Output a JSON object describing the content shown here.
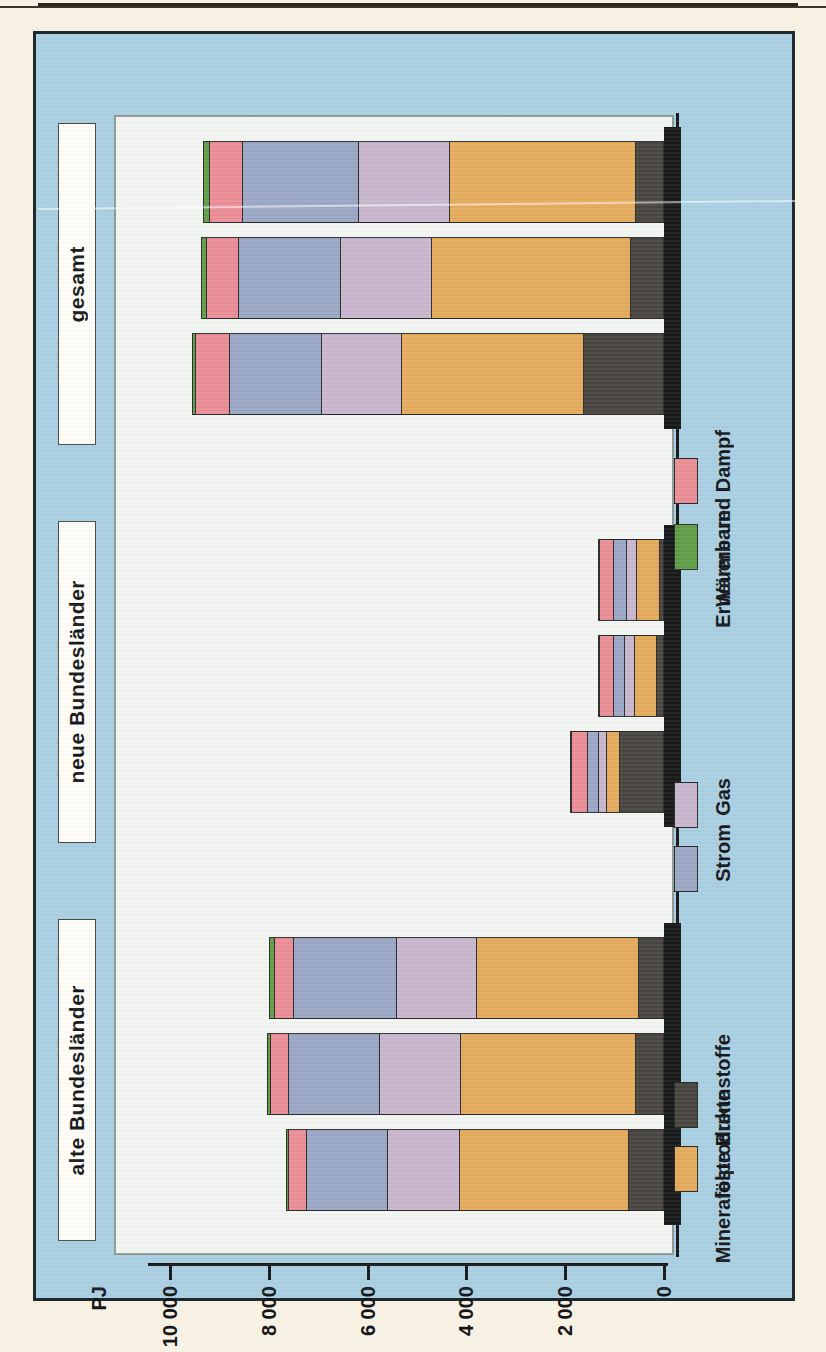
{
  "chart_data": {
    "type": "bar",
    "subtype": "stacked-horizontal",
    "title": "",
    "xlabel": "",
    "ylabel": "PJ",
    "unit": "PJ",
    "axis_ticks": [
      "10000",
      "8000",
      "6000",
      "4000",
      "2000",
      "0"
    ],
    "axis_tick_values": [
      10000,
      8000,
      6000,
      4000,
      2000,
      0
    ],
    "ylim": [
      0,
      10000
    ],
    "grid": false,
    "legend_position": "right",
    "orientation": "rotated-90",
    "categories": [
      "1990",
      "2005",
      "2020"
    ],
    "groups": [
      "alte Bundesländer",
      "neue Bundesländer",
      "gesamt"
    ],
    "series": [
      {
        "name": "feste Brennstoffe",
        "color": "#494641",
        "values": {
          "alte Bundesländer": [
            700,
            540,
            480
          ],
          "neue Bundesländer": [
            900,
            120,
            60
          ],
          "gesamt": [
            1600,
            660,
            540
          ]
        }
      },
      {
        "name": "Mineralölprodukte",
        "color": "#e3ab5c",
        "values": {
          "alte Bundesländer": [
            3440,
            3560,
            3300
          ],
          "neue Bundesländer": [
            260,
            470,
            490
          ],
          "gesamt": [
            3700,
            4030,
            3790
          ]
        }
      },
      {
        "name": "Gas",
        "color": "#c8b6cc",
        "values": {
          "alte Bundesländer": [
            1450,
            1650,
            1640
          ],
          "neue Bundesländer": [
            180,
            200,
            210
          ],
          "gesamt": [
            1630,
            1850,
            1850
          ]
        }
      },
      {
        "name": "Strom",
        "color": "#9aa7c4",
        "values": {
          "alte Bundesländer": [
            1660,
            1850,
            2090
          ],
          "neue Bundesländer": [
            220,
            240,
            260
          ],
          "gesamt": [
            1880,
            2090,
            2350
          ]
        }
      },
      {
        "name": "Wärme und Dampf",
        "color": "#ea8d96",
        "values": {
          "alte Bundesländer": [
            360,
            370,
            380
          ],
          "neue Bundesländer": [
            330,
            280,
            290
          ],
          "gesamt": [
            690,
            650,
            670
          ]
        }
      },
      {
        "name": "Erneuerbare",
        "color": "#5f9e48",
        "values": {
          "alte Bundesländer": [
            40,
            70,
            110
          ],
          "neue Bundesländer": [
            10,
            20,
            30
          ],
          "gesamt": [
            50,
            90,
            140
          ]
        }
      }
    ],
    "totals": {
      "alte Bundesländer": [
        7650,
        8040,
        8000
      ],
      "neue Bundesländer": [
        1900,
        1330,
        1340
      ],
      "gesamt": [
        9550,
        9370,
        9340
      ]
    }
  },
  "axis": {
    "unit_label": "PJ",
    "ticks": [
      "10000",
      "8000",
      "6000",
      "4000",
      "2000",
      "0"
    ]
  },
  "groups": [
    {
      "key": "gesamt",
      "label": "gesamt",
      "years": [
        "2020",
        "2005",
        "1990"
      ]
    },
    {
      "key": "neue",
      "label": "neue Bundesländer",
      "years": [
        "2020",
        "2005",
        "1990"
      ]
    },
    {
      "key": "alte",
      "label": "alte Bundesländer",
      "years": [
        "2020",
        "2005",
        "1990"
      ]
    }
  ],
  "legend": {
    "items": [
      {
        "label": "Wärme und Dampf",
        "color": "#ea8d96",
        "swatch_name": "legend-swatch-waerme-und-dampf"
      },
      {
        "label": "Erneuerbare",
        "color": "#5f9e48",
        "swatch_name": "legend-swatch-erneuerbare"
      },
      {
        "label": "Gas",
        "color": "#c8b6cc",
        "swatch_name": "legend-swatch-gas"
      },
      {
        "label": "Strom",
        "color": "#9aa7c4",
        "swatch_name": "legend-swatch-strom"
      },
      {
        "label": "feste Brennstoffe",
        "color": "#494641",
        "swatch_name": "legend-swatch-feste-brennstoffe"
      },
      {
        "label": "Mineralölprodukte",
        "color": "#e3ab5c",
        "swatch_name": "legend-swatch-mineraloelprodukte"
      }
    ]
  },
  "colors": {
    "page_background": "#f7f1e3",
    "panel_background": "#a9cfe2",
    "plot_background": "#f2f4f2",
    "ink": "#16181a"
  }
}
